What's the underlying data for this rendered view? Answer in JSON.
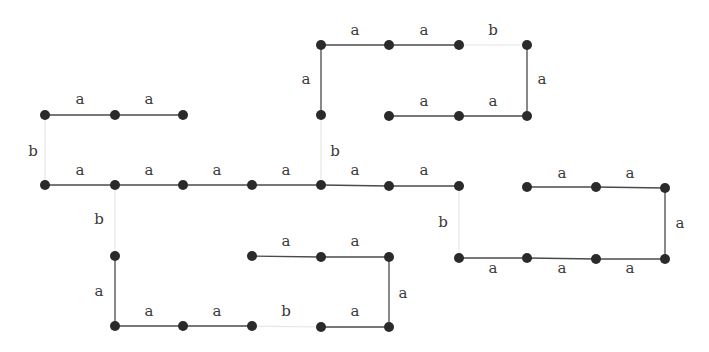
{
  "diagram": {
    "title": "",
    "colors": {
      "edge_a": "#4a4a4a",
      "edge_b": "#e6e6e6",
      "node": "#2a2a2a",
      "label": "#3a3a3a"
    },
    "nodes": [
      {
        "id": "n1",
        "x": 45,
        "y": 115
      },
      {
        "id": "n2",
        "x": 115,
        "y": 115
      },
      {
        "id": "n3",
        "x": 183,
        "y": 115
      },
      {
        "id": "n4",
        "x": 321,
        "y": 45
      },
      {
        "id": "n5",
        "x": 389,
        "y": 45
      },
      {
        "id": "n6",
        "x": 459,
        "y": 45
      },
      {
        "id": "n7",
        "x": 527,
        "y": 45
      },
      {
        "id": "n8",
        "x": 321,
        "y": 115
      },
      {
        "id": "n9",
        "x": 389,
        "y": 116
      },
      {
        "id": "n10",
        "x": 459,
        "y": 116
      },
      {
        "id": "n11",
        "x": 527,
        "y": 116
      },
      {
        "id": "n12",
        "x": 45,
        "y": 185
      },
      {
        "id": "n13",
        "x": 115,
        "y": 185
      },
      {
        "id": "n14",
        "x": 183,
        "y": 185
      },
      {
        "id": "n15",
        "x": 252,
        "y": 185
      },
      {
        "id": "n16",
        "x": 321,
        "y": 185
      },
      {
        "id": "n17",
        "x": 389,
        "y": 186
      },
      {
        "id": "n18",
        "x": 459,
        "y": 186
      },
      {
        "id": "n19",
        "x": 527,
        "y": 187
      },
      {
        "id": "n20",
        "x": 596,
        "y": 187
      },
      {
        "id": "n21",
        "x": 665,
        "y": 188
      },
      {
        "id": "n22",
        "x": 459,
        "y": 258
      },
      {
        "id": "n23",
        "x": 527,
        "y": 258
      },
      {
        "id": "n24",
        "x": 596,
        "y": 259
      },
      {
        "id": "n25",
        "x": 665,
        "y": 259
      },
      {
        "id": "n26",
        "x": 115,
        "y": 256
      },
      {
        "id": "n27",
        "x": 252,
        "y": 256
      },
      {
        "id": "n28",
        "x": 321,
        "y": 257
      },
      {
        "id": "n29",
        "x": 389,
        "y": 257
      },
      {
        "id": "n30",
        "x": 115,
        "y": 326
      },
      {
        "id": "n31",
        "x": 183,
        "y": 326
      },
      {
        "id": "n32",
        "x": 252,
        "y": 326
      },
      {
        "id": "n33",
        "x": 321,
        "y": 327
      },
      {
        "id": "n34",
        "x": 389,
        "y": 327
      }
    ],
    "edges": [
      {
        "from": "n1",
        "to": "n2",
        "label": "a"
      },
      {
        "from": "n2",
        "to": "n3",
        "label": "a"
      },
      {
        "from": "n4",
        "to": "n5",
        "label": "a"
      },
      {
        "from": "n5",
        "to": "n6",
        "label": "a"
      },
      {
        "from": "n6",
        "to": "n7",
        "label": "b"
      },
      {
        "from": "n4",
        "to": "n8",
        "label": "a"
      },
      {
        "from": "n7",
        "to": "n11",
        "label": "a"
      },
      {
        "from": "n9",
        "to": "n10",
        "label": "a"
      },
      {
        "from": "n10",
        "to": "n11",
        "label": "a"
      },
      {
        "from": "n12",
        "to": "n13",
        "label": "a"
      },
      {
        "from": "n13",
        "to": "n14",
        "label": "a"
      },
      {
        "from": "n14",
        "to": "n15",
        "label": "a"
      },
      {
        "from": "n15",
        "to": "n16",
        "label": "a"
      },
      {
        "from": "n16",
        "to": "n17",
        "label": "a"
      },
      {
        "from": "n17",
        "to": "n18",
        "label": "a"
      },
      {
        "from": "n1",
        "to": "n12",
        "label": "b"
      },
      {
        "from": "n8",
        "to": "n16",
        "label": "b"
      },
      {
        "from": "n13",
        "to": "n26",
        "label": "b"
      },
      {
        "from": "n18",
        "to": "n22",
        "label": "b"
      },
      {
        "from": "n19",
        "to": "n20",
        "label": "a"
      },
      {
        "from": "n20",
        "to": "n21",
        "label": "a"
      },
      {
        "from": "n21",
        "to": "n25",
        "label": "a"
      },
      {
        "from": "n22",
        "to": "n23",
        "label": "a"
      },
      {
        "from": "n23",
        "to": "n24",
        "label": "a"
      },
      {
        "from": "n24",
        "to": "n25",
        "label": "a"
      },
      {
        "from": "n26",
        "to": "n30",
        "label": "a"
      },
      {
        "from": "n30",
        "to": "n31",
        "label": "a"
      },
      {
        "from": "n31",
        "to": "n32",
        "label": "a"
      },
      {
        "from": "n32",
        "to": "n33",
        "label": "b"
      },
      {
        "from": "n33",
        "to": "n34",
        "label": "a"
      },
      {
        "from": "n27",
        "to": "n28",
        "label": "a"
      },
      {
        "from": "n28",
        "to": "n29",
        "label": "a"
      },
      {
        "from": "n29",
        "to": "n34",
        "label": "a"
      }
    ],
    "labels": [
      {
        "text": "a",
        "x": 80,
        "y": 104
      },
      {
        "text": "a",
        "x": 149,
        "y": 104
      },
      {
        "text": "a",
        "x": 355,
        "y": 35
      },
      {
        "text": "a",
        "x": 424,
        "y": 35
      },
      {
        "text": "b",
        "x": 493,
        "y": 35
      },
      {
        "text": "a",
        "x": 306,
        "y": 84
      },
      {
        "text": "a",
        "x": 542,
        "y": 84
      },
      {
        "text": "a",
        "x": 424,
        "y": 106
      },
      {
        "text": "a",
        "x": 493,
        "y": 106
      },
      {
        "text": "b",
        "x": 33,
        "y": 156
      },
      {
        "text": "a",
        "x": 80,
        "y": 175
      },
      {
        "text": "a",
        "x": 149,
        "y": 175
      },
      {
        "text": "a",
        "x": 217,
        "y": 175
      },
      {
        "text": "a",
        "x": 286,
        "y": 175
      },
      {
        "text": "a",
        "x": 355,
        "y": 175
      },
      {
        "text": "a",
        "x": 424,
        "y": 175
      },
      {
        "text": "b",
        "x": 335,
        "y": 156
      },
      {
        "text": "a",
        "x": 562,
        "y": 178
      },
      {
        "text": "a",
        "x": 630,
        "y": 178
      },
      {
        "text": "b",
        "x": 99,
        "y": 224
      },
      {
        "text": "b",
        "x": 443,
        "y": 227
      },
      {
        "text": "a",
        "x": 680,
        "y": 228
      },
      {
        "text": "a",
        "x": 286,
        "y": 246
      },
      {
        "text": "a",
        "x": 355,
        "y": 246
      },
      {
        "text": "a",
        "x": 493,
        "y": 273
      },
      {
        "text": "a",
        "x": 562,
        "y": 273
      },
      {
        "text": "a",
        "x": 630,
        "y": 273
      },
      {
        "text": "a",
        "x": 99,
        "y": 296
      },
      {
        "text": "a",
        "x": 403,
        "y": 298
      },
      {
        "text": "a",
        "x": 149,
        "y": 316
      },
      {
        "text": "a",
        "x": 217,
        "y": 316
      },
      {
        "text": "b",
        "x": 286,
        "y": 316
      },
      {
        "text": "a",
        "x": 355,
        "y": 316
      }
    ]
  }
}
